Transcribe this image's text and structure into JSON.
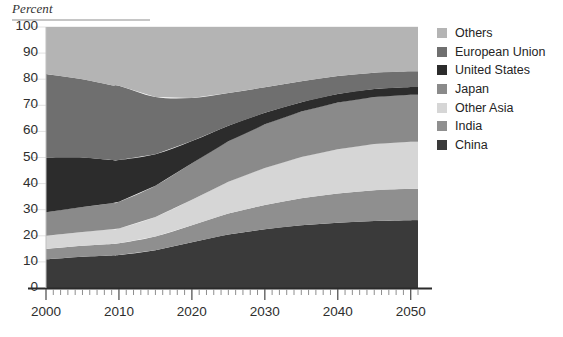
{
  "chart_data": {
    "type": "area",
    "title": "",
    "subtitle": "",
    "ylabel": "Percent",
    "xlabel": "",
    "ylim": [
      0,
      100
    ],
    "xlim": [
      2000,
      2051
    ],
    "grid": true,
    "stacked": true,
    "legend_position": "right",
    "y_ticks": [
      "0",
      "10",
      "20",
      "30",
      "40",
      "50",
      "60",
      "70",
      "80",
      "90",
      "100"
    ],
    "x_ticks": [
      "2000",
      "2010",
      "2020",
      "2030",
      "2040",
      "2050"
    ],
    "x": [
      2000,
      2005,
      2009,
      2010,
      2015,
      2020,
      2025,
      2030,
      2035,
      2040,
      2045,
      2050,
      2051
    ],
    "series": [
      {
        "name": "China",
        "color": "#3a3a3a",
        "values": [
          11,
          12,
          12.5,
          12.6,
          14.5,
          17.5,
          20.5,
          22.5,
          24,
          25,
          25.7,
          26,
          26
        ]
      },
      {
        "name": "India",
        "color": "#8f8f8f",
        "values": [
          4,
          4.2,
          4.4,
          4.5,
          5.2,
          6.5,
          8,
          9.3,
          10.4,
          11.2,
          11.8,
          12,
          12
        ]
      },
      {
        "name": "Other Asia",
        "color": "#d6d6d6",
        "values": [
          5,
          5.3,
          5.6,
          5.7,
          7.5,
          9.8,
          12.2,
          14.2,
          15.8,
          17,
          17.7,
          18,
          18
        ]
      },
      {
        "name": "Japan",
        "color": "#8a8a8a",
        "values": [
          9,
          9.5,
          10,
          10.2,
          12,
          14,
          15.5,
          16.7,
          17.4,
          17.9,
          18,
          18,
          18
        ]
      },
      {
        "name": "United States",
        "color": "#2c2c2c",
        "values": [
          21,
          19,
          16.5,
          16,
          12,
          8.5,
          6,
          4.4,
          3.6,
          3.2,
          3,
          3,
          3
        ]
      },
      {
        "name": "European Union",
        "color": "#6f6f6f",
        "values": [
          32,
          30,
          28.7,
          28.5,
          22,
          16.5,
          12.5,
          9.8,
          8,
          6.9,
          6.3,
          6,
          6
        ]
      },
      {
        "name": "Others",
        "color": "#b4b4b4",
        "values": [
          18,
          20,
          22.3,
          22.5,
          26.8,
          27.2,
          25.3,
          23.1,
          20.8,
          18.8,
          17.5,
          17,
          17
        ]
      }
    ],
    "legend": [
      {
        "label": "Others",
        "color": "#b4b4b4"
      },
      {
        "label": "European Union",
        "color": "#6f6f6f"
      },
      {
        "label": "United States",
        "color": "#2c2c2c"
      },
      {
        "label": "Japan",
        "color": "#8a8a8a"
      },
      {
        "label": "Other Asia",
        "color": "#d6d6d6"
      },
      {
        "label": "India",
        "color": "#8f8f8f"
      },
      {
        "label": "China",
        "color": "#3a3a3a"
      }
    ],
    "axis_color": "#2b2b2b",
    "grid_color": "#e2e2e2"
  }
}
